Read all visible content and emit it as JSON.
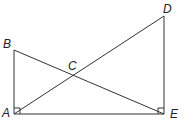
{
  "diagram": {
    "type": "geometry",
    "points": {
      "A": {
        "label": "A",
        "x": 14,
        "y": 114
      },
      "B": {
        "label": "B",
        "x": 14,
        "y": 50
      },
      "C": {
        "label": "C",
        "x": 73,
        "y": 76
      },
      "D": {
        "label": "D",
        "x": 164,
        "y": 16
      },
      "E": {
        "label": "E",
        "x": 164,
        "y": 114
      }
    },
    "segments": [
      "AB",
      "AE",
      "ED",
      "BE",
      "AD"
    ],
    "right_angles": [
      "A",
      "E"
    ],
    "line_color": "#333333",
    "label_color": "#222222"
  }
}
